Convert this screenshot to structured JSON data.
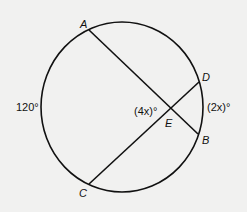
{
  "diagram": {
    "type": "circle-intersecting-chords",
    "colors": {
      "stroke": "#111111",
      "background": "#f1f1f0",
      "text": "#111111"
    },
    "circle": {
      "cx": 122,
      "cy": 107,
      "rx": 81,
      "ry": 85
    },
    "points": {
      "A": {
        "label": "A",
        "x": 89,
        "y": 30
      },
      "B": {
        "label": "B",
        "x": 198,
        "y": 134
      },
      "C": {
        "label": "C",
        "x": 89,
        "y": 184
      },
      "D": {
        "label": "D",
        "x": 199,
        "y": 82
      },
      "E": {
        "label": "E",
        "x": 171,
        "y": 108
      }
    },
    "chords": [
      {
        "from": "A",
        "to": "B"
      },
      {
        "from": "C",
        "to": "D"
      }
    ],
    "angle_labels": {
      "arc_AC": "120°",
      "angle_AEC": "(4x)°",
      "arc_DB": "(2x)°"
    }
  }
}
